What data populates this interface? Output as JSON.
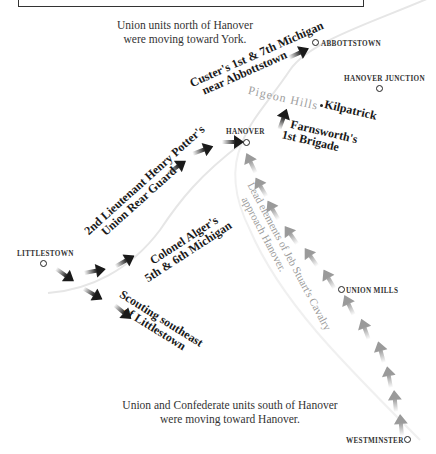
{
  "map": {
    "notes": {
      "north_line1": "Union units north of Hanover",
      "north_line2": "were moving toward York.",
      "south_line1": "Union and Confederate units south of Hanover",
      "south_line2": "were moving toward Hanover."
    },
    "towns": {
      "abbottstown": "ABBOTTSTOWN",
      "hanover_junction": "HANOVER JUNCTION",
      "hanover": "HANOVER",
      "littlestown": "LITTLESTOWN",
      "union_mills": "UNION MILLS",
      "westminster": "WESTMINSTER"
    },
    "features": {
      "pigeon_hills": "Pigeon Hills",
      "kilpatrick": "Kilpatrick"
    },
    "units": {
      "custer_line1": "Custer's 1st & 7th Michigan",
      "custer_line2": "near Abbottstown",
      "farnsworth_line1": "Farnsworth's",
      "farnsworth_line2": "1st Brigade",
      "potter_line1": "2nd Lieutenant Henry Potter's",
      "potter_line2": "Union Rear Guard",
      "alger_line1": "Colonel Alger's",
      "alger_line2": "5th & 6th Michigan",
      "scouting_line1": "Scouting southeast",
      "scouting_line2": "of Littlestown",
      "stuart_line1": "Lead elements of Jeb Stuart's Cavalry",
      "stuart_line2": "approach Hanover."
    },
    "colors": {
      "union_arrow": "#1a1a1a",
      "confederate_arrow": "#9a9a9a",
      "road": "#e4e4e4"
    }
  }
}
